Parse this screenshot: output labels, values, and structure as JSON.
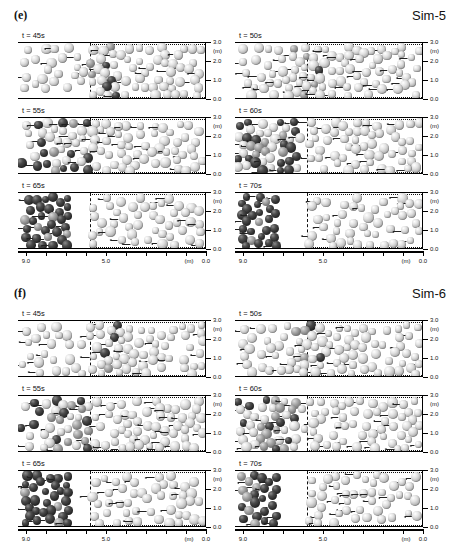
{
  "figure": {
    "type": "particle-simulation-snapshots",
    "sections": [
      {
        "id": "e",
        "label": "(e)",
        "sim_label": "Sim-5",
        "panels": [
          {
            "time_label": "t = 45s",
            "row": 0,
            "col": 0,
            "front_x": 5.8,
            "dark_front_x": 5.2,
            "dark_band_x": 4.9,
            "fill": "sparse"
          },
          {
            "time_label": "t = 50s",
            "row": 0,
            "col": 1,
            "front_x": 5.8,
            "dark_front_x": 6.1,
            "dark_band_x": 5.6,
            "fill": "sparse"
          },
          {
            "time_label": "t = 55s",
            "row": 1,
            "col": 0,
            "front_x": 5.8,
            "dark_front_x": 7.6,
            "dark_band_x": 6.5,
            "fill": "medium"
          },
          {
            "time_label": "t = 60s",
            "row": 1,
            "col": 1,
            "front_x": 5.8,
            "dark_front_x": 8.3,
            "dark_band_x": 7.0,
            "fill": "medium"
          },
          {
            "time_label": "t = 65s",
            "row": 2,
            "col": 0,
            "front_x": 5.8,
            "dark_front_x": 9.0,
            "dark_band_x": 7.6,
            "fill": "dense"
          },
          {
            "time_label": "t = 70s",
            "row": 2,
            "col": 1,
            "front_x": 5.8,
            "dark_front_x": 9.0,
            "dark_band_x": 8.0,
            "fill": "dense"
          }
        ]
      },
      {
        "id": "f",
        "label": "(f)",
        "sim_label": "Sim-6",
        "panels": [
          {
            "time_label": "t = 45s",
            "row": 0,
            "col": 0,
            "front_x": 5.8,
            "dark_front_x": 5.0,
            "dark_band_x": 4.7,
            "fill": "sparse"
          },
          {
            "time_label": "t = 50s",
            "row": 0,
            "col": 1,
            "front_x": 5.8,
            "dark_front_x": 6.0,
            "dark_band_x": 5.5,
            "fill": "sparse"
          },
          {
            "time_label": "t = 55s",
            "row": 1,
            "col": 0,
            "front_x": 5.8,
            "dark_front_x": 7.4,
            "dark_band_x": 6.4,
            "fill": "medium"
          },
          {
            "time_label": "t = 60s",
            "row": 1,
            "col": 1,
            "front_x": 5.8,
            "dark_front_x": 8.1,
            "dark_band_x": 6.9,
            "fill": "medium"
          },
          {
            "time_label": "t = 65s",
            "row": 2,
            "col": 0,
            "front_x": 5.8,
            "dark_front_x": 9.0,
            "dark_band_x": 7.5,
            "fill": "dense"
          },
          {
            "time_label": "t = 70s",
            "row": 2,
            "col": 1,
            "front_x": 5.8,
            "dark_front_x": 9.0,
            "dark_band_x": 7.9,
            "fill": "dense"
          }
        ]
      }
    ],
    "axes": {
      "x": {
        "unit_label": "(m)",
        "ticks": [
          {
            "value": 9.0,
            "label": "9.0"
          },
          {
            "value": 8.0,
            "label": ""
          },
          {
            "value": 7.0,
            "label": ""
          },
          {
            "value": 6.0,
            "label": ""
          },
          {
            "value": 5.0,
            "label": "5.0"
          },
          {
            "value": 4.0,
            "label": ""
          },
          {
            "value": 3.0,
            "label": ""
          },
          {
            "value": 2.0,
            "label": ""
          },
          {
            "value": 1.0,
            "label": ""
          },
          {
            "value": 0.0,
            "label": "0.0"
          }
        ],
        "min": 0.0,
        "max": 9.4,
        "direction": "right-to-left"
      },
      "y": {
        "unit_label": "(m)",
        "ticks": [
          {
            "value": 3.0,
            "label": "3.0"
          },
          {
            "value": 2.0,
            "label": "2.0"
          },
          {
            "value": 1.0,
            "label": "1.0"
          },
          {
            "value": 0.0,
            "label": "0.0"
          }
        ],
        "min": 0.0,
        "max": 3.0
      },
      "reservoir_boundary_x": 5.8
    },
    "legend": {
      "light_particle": "light-grey sphere",
      "dark_particle": "dark-grey sphere"
    }
  }
}
